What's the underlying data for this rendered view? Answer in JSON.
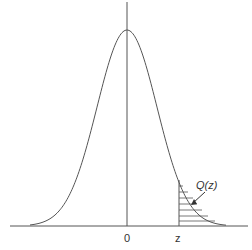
{
  "chart_data": {
    "type": "line",
    "title": "",
    "xlabel": "",
    "ylabel": "",
    "x_tick_labels": [
      "0",
      "z"
    ],
    "annotations": [
      {
        "text": "Q(z)",
        "points_to": "shaded right tail area beyond z"
      }
    ],
    "series": [
      {
        "name": "normal pdf",
        "x": [
          -3,
          -2,
          -1,
          0,
          1,
          2,
          3
        ],
        "values": [
          0.004,
          0.054,
          0.242,
          0.399,
          0.242,
          0.054,
          0.004
        ]
      }
    ],
    "shaded_region": {
      "from": "z",
      "to": "+inf",
      "pattern": "horizontal-hatch"
    },
    "grid": false,
    "legend": null
  },
  "labels": {
    "origin": "0",
    "z": "z",
    "tail": "Q(z)"
  },
  "colors": {
    "line": "#555555",
    "text": "#333333"
  }
}
